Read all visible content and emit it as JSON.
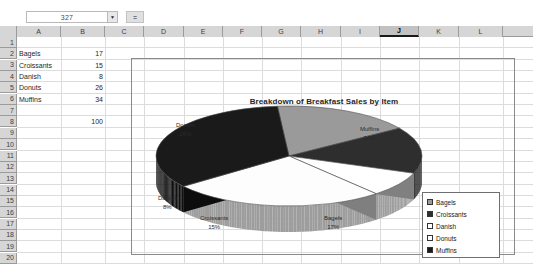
{
  "formula_bar": {
    "name_box_value": "327",
    "name_box_dropdown_icon": "chevron-down-icon",
    "formula_icon": "equals-icon",
    "formula_icon_glyph": "=",
    "formula_value": ""
  },
  "grid": {
    "columns": [
      "A",
      "B",
      "C",
      "D",
      "E",
      "F",
      "G",
      "H",
      "I",
      "J",
      "K",
      "L"
    ],
    "selected_column": "J",
    "rows": [
      "1",
      "2",
      "3",
      "4",
      "5",
      "6",
      "7",
      "8",
      "9",
      "10",
      "11",
      "12",
      "13",
      "14",
      "15",
      "16",
      "17",
      "18",
      "19",
      "20"
    ],
    "cells": [
      {
        "col": "A",
        "row": "2",
        "value": "Bagels",
        "type": "text"
      },
      {
        "col": "A",
        "row": "3",
        "value": "Croissants",
        "type": "text"
      },
      {
        "col": "A",
        "row": "4",
        "value": "Danish",
        "type": "text"
      },
      {
        "col": "A",
        "row": "5",
        "value": "Donuts",
        "type": "text"
      },
      {
        "col": "A",
        "row": "6",
        "value": "Muffins",
        "type": "text"
      },
      {
        "col": "B",
        "row": "2",
        "value": "17",
        "type": "number"
      },
      {
        "col": "B",
        "row": "3",
        "value": "15",
        "type": "number"
      },
      {
        "col": "B",
        "row": "4",
        "value": "8",
        "type": "number"
      },
      {
        "col": "B",
        "row": "5",
        "value": "26",
        "type": "number"
      },
      {
        "col": "B",
        "row": "6",
        "value": "34",
        "type": "number"
      },
      {
        "col": "B",
        "row": "8",
        "value": "100",
        "type": "number"
      }
    ]
  },
  "chart_data": {
    "type": "pie",
    "title": "Breakdown of Breakfast Sales by Item",
    "three_d": true,
    "categories": [
      "Bagels",
      "Croissants",
      "Danish",
      "Donuts",
      "Muffins"
    ],
    "values": [
      17,
      15,
      8,
      26,
      34
    ],
    "percent_labels": [
      "17%",
      "15%",
      "8%",
      "26%",
      "34%"
    ],
    "data_labels": [
      {
        "name": "Donuts",
        "percent": "26%"
      },
      {
        "name": "Muffins",
        "percent": "34%"
      },
      {
        "name": "Danish",
        "percent": "8%"
      },
      {
        "name": "Croissants",
        "percent": "15%"
      },
      {
        "name": "Bagels",
        "percent": "17%"
      }
    ],
    "colors": [
      "#9a9a9a",
      "#2e2e2e",
      "#ffffff",
      "#fdfdfd",
      "#1a1a1a"
    ],
    "legend_position": "right",
    "legend_entries": [
      {
        "label": "Bagels",
        "color": "#9a9a9a"
      },
      {
        "label": "Croissants",
        "color": "#2e2e2e"
      },
      {
        "label": "Danish",
        "color": "#ffffff"
      },
      {
        "label": "Donuts",
        "color": "#fdfdfd"
      },
      {
        "label": "Muffins",
        "color": "#1a1a1a"
      }
    ]
  }
}
